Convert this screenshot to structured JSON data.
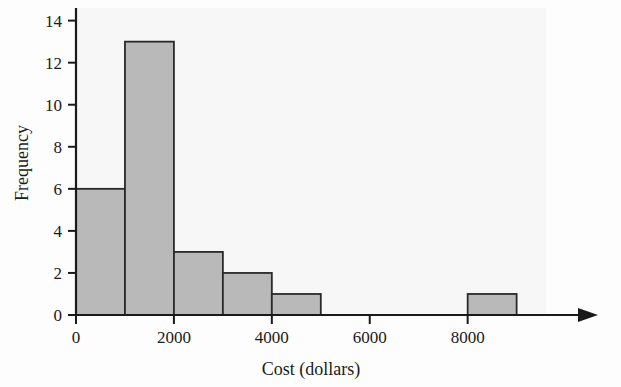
{
  "chart_data": {
    "type": "bar",
    "title": "",
    "subtitle": "",
    "xlabel": "Cost (dollars)",
    "ylabel": "Frequency",
    "bin_width": 1000,
    "bin_edges": [
      0,
      1000,
      2000,
      3000,
      4000,
      5000,
      8000,
      9000
    ],
    "categories": [
      "0-1000",
      "1000-2000",
      "2000-3000",
      "3000-4000",
      "4000-5000",
      "8000-9000"
    ],
    "bins": [
      {
        "label": "0-1000",
        "start": 0,
        "end": 1000,
        "value": 6
      },
      {
        "label": "1000-2000",
        "start": 1000,
        "end": 2000,
        "value": 13
      },
      {
        "label": "2000-3000",
        "start": 2000,
        "end": 3000,
        "value": 3
      },
      {
        "label": "3000-4000",
        "start": 3000,
        "end": 4000,
        "value": 2
      },
      {
        "label": "4000-5000",
        "start": 4000,
        "end": 5000,
        "value": 1
      },
      {
        "label": "8000-9000",
        "start": 8000,
        "end": 9000,
        "value": 1
      }
    ],
    "values": [
      6,
      13,
      3,
      2,
      1,
      1
    ],
    "xlim": [
      0,
      9600
    ],
    "ylim": [
      0,
      14.6
    ],
    "xticks": [
      0,
      2000,
      4000,
      6000,
      8000
    ],
    "xtick_labels": [
      "0",
      "2000",
      "4000",
      "6000",
      "8000"
    ],
    "yticks": [
      0,
      2,
      4,
      6,
      8,
      10,
      12,
      14
    ],
    "ytick_labels": [
      "0",
      "2",
      "4",
      "6",
      "8",
      "10",
      "12",
      "14"
    ],
    "grid": false,
    "legend": false,
    "legend_position": "none",
    "bar_fill_color": "#b9b9b9",
    "bar_edge_color": "#2a2a2a",
    "axis_color": "#1a1a1a",
    "plot_background_color": "#f7f7f7",
    "page_background_color": "#fdfdfd",
    "x_axis_has_arrow": true
  },
  "axes": {
    "y_title": "Frequency",
    "x_title": "Cost (dollars)"
  },
  "ticks": {
    "y": [
      "0",
      "2",
      "4",
      "6",
      "8",
      "10",
      "12",
      "14"
    ],
    "x": [
      "0",
      "2000",
      "4000",
      "6000",
      "8000"
    ]
  }
}
